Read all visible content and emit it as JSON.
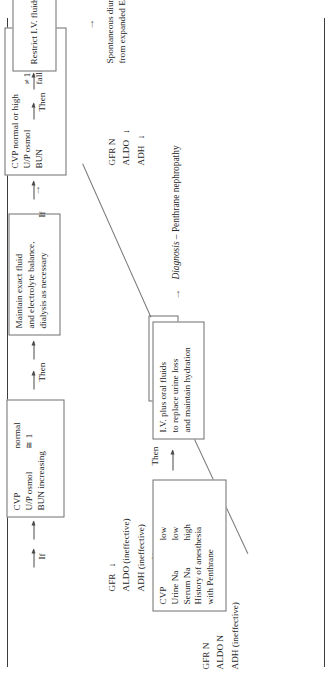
{
  "figure": {
    "type": "clinical-decision-flowchart",
    "orientation": "rotated-90-ccw",
    "root": {
      "label": "Urine volume high"
    },
    "connector_if": "If",
    "connector_then": "Then",
    "branches": [
      {
        "id": "branch-penthrane",
        "labs": [
          {
            "key": "GFR N",
            "arrow": ""
          },
          {
            "key": "ALDO N",
            "arrow": ""
          },
          {
            "key": "ADH (ineffective)",
            "arrow": ""
          }
        ],
        "condition": {
          "rows": [
            {
              "name": "CVP",
              "value": "low"
            },
            {
              "name": "Urine Na",
              "value": "low"
            },
            {
              "name": "Serum Na",
              "value": "high"
            }
          ],
          "extra": [
            "History of anesthesia",
            "with Penthrane"
          ]
        },
        "action": [
          "I.V. plus oral fluids",
          "to replace urine loss",
          "and maintain hydration"
        ],
        "outcome": [
          "Diagnosis – Penthrane nephropathy"
        ],
        "outcome_italic_word": "Diagnosis"
      },
      {
        "id": "branch-high-output",
        "labs": [
          {
            "key": "GFR",
            "arrow": "↓"
          },
          {
            "key": "ALDO (ineffective)",
            "arrow": ""
          },
          {
            "key": "ADH (ineffective)",
            "arrow": ""
          }
        ],
        "condition": {
          "rows": [
            {
              "name": "CVP",
              "value": "normal"
            },
            {
              "name": "U/P osmol",
              "value": "≅ 1"
            },
            {
              "name": "BUN increasing",
              "value": ""
            }
          ],
          "extra": []
        },
        "action": [
          "Maintain exact fluid",
          "and electrolyte balance,",
          "dialysis as necessary"
        ],
        "outcome": [
          "High output renal failure"
        ],
        "outcome_italic_word": ""
      },
      {
        "id": "branch-spontaneous-diuresis",
        "labs": [
          {
            "key": "GFR N",
            "arrow": ""
          },
          {
            "key": "ALDO",
            "arrow": "↓"
          },
          {
            "key": "ADH",
            "arrow": "↓"
          }
        ],
        "condition": {
          "rows": [
            {
              "name": "CVP normal or high",
              "value": ""
            },
            {
              "name": "U/P osmol",
              "value": "≠ 1"
            },
            {
              "name": "BUN",
              "value": "falling"
            }
          ],
          "extra": []
        },
        "action": [
          "Restrict I.V. fluids"
        ],
        "outcome": [
          "Spontaneous diuresis",
          "from expanded ECF"
        ],
        "outcome_italic_word": ""
      }
    ],
    "colors": {
      "ink": "#262626",
      "rule": "#3c3c3c",
      "box_border": "#6e6e6e",
      "leader": "#777777",
      "page": "#ffffff"
    }
  }
}
